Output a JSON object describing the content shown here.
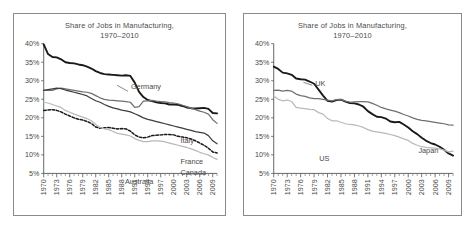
{
  "figure": {
    "background_color": "#ffffff",
    "panel_border_color": "#8a8a8a"
  },
  "panels": [
    {
      "id": "left",
      "title_line1": "Share of Jobs in Manufacturing,",
      "title_line2": "1970–2010",
      "series_labels": [
        "Germany",
        "Italy",
        "France",
        "Canada",
        "Australia"
      ]
    },
    {
      "id": "right",
      "title_line1": "Share of Jobs in Manufacturing,",
      "title_line2": "1970–2010",
      "series_labels": [
        "UK",
        "US",
        "Japan"
      ]
    }
  ],
  "chart_data": [
    {
      "type": "line",
      "panel": "left",
      "title": "Share of Jobs in Manufacturing, 1970–2010",
      "xlabel": "",
      "ylabel": "",
      "ylim": [
        5,
        40
      ],
      "yticks": [
        5,
        10,
        15,
        20,
        25,
        30,
        35,
        40
      ],
      "ytick_labels": [
        "5%",
        "10%",
        "15%",
        "20%",
        "25%",
        "30%",
        "35%",
        "40%"
      ],
      "xlim": [
        1970,
        2010
      ],
      "xticks": [
        1970,
        1973,
        1976,
        1979,
        1982,
        1985,
        1988,
        1991,
        1994,
        1997,
        2000,
        2003,
        2006,
        2009
      ],
      "xtick_labels": [
        "1970",
        "1973",
        "1976",
        "1979",
        "1982",
        "1985",
        "1988",
        "1991",
        "1994",
        "1997",
        "2000",
        "2003",
        "2006",
        "2009"
      ],
      "grid": false,
      "legend": "inline-labels",
      "x": [
        1970,
        1971,
        1972,
        1973,
        1974,
        1975,
        1976,
        1977,
        1978,
        1979,
        1980,
        1981,
        1982,
        1983,
        1984,
        1985,
        1986,
        1987,
        1988,
        1989,
        1990,
        1991,
        1992,
        1993,
        1994,
        1995,
        1996,
        1997,
        1998,
        1999,
        2000,
        2001,
        2002,
        2003,
        2004,
        2005,
        2006,
        2007,
        2008,
        2009,
        2010
      ],
      "series": [
        {
          "name": "Germany",
          "style": "solid-black-thick",
          "color": "#1a1a1a",
          "values": [
            39.8,
            37.2,
            36.4,
            36.3,
            35.8,
            35.0,
            34.8,
            34.7,
            34.4,
            34.2,
            33.8,
            33.3,
            32.6,
            32.1,
            31.8,
            31.7,
            31.6,
            31.5,
            31.4,
            31.5,
            31.3,
            29.5,
            27.0,
            25.6,
            24.8,
            24.5,
            24.2,
            24.0,
            23.9,
            23.6,
            23.6,
            23.5,
            23.2,
            22.8,
            22.6,
            22.5,
            22.6,
            22.7,
            22.4,
            21.3,
            21.2
          ]
        },
        {
          "name": "Italy",
          "style": "solid-gray",
          "color": "#6f6f6f",
          "values": [
            27.5,
            27.4,
            27.4,
            27.8,
            28.0,
            27.8,
            27.6,
            27.4,
            27.2,
            27.0,
            26.9,
            26.6,
            26.0,
            25.4,
            25.0,
            24.8,
            24.7,
            24.6,
            24.5,
            24.4,
            24.2,
            22.8,
            23.0,
            24.5,
            24.6,
            24.7,
            24.5,
            24.4,
            24.3,
            24.1,
            24.0,
            23.8,
            23.4,
            23.0,
            22.6,
            22.2,
            21.8,
            21.5,
            21.0,
            19.5,
            18.5
          ]
        },
        {
          "name": "France",
          "style": "solid-dark-gray",
          "color": "#3d3d3d",
          "values": [
            27.4,
            27.6,
            27.8,
            28.0,
            27.9,
            27.5,
            27.2,
            26.9,
            26.6,
            26.3,
            25.9,
            25.2,
            24.6,
            24.2,
            23.6,
            23.1,
            22.7,
            22.4,
            22.1,
            21.9,
            21.6,
            21.1,
            20.6,
            20.0,
            19.6,
            19.3,
            19.0,
            18.7,
            18.4,
            18.1,
            17.8,
            17.5,
            17.2,
            16.9,
            16.6,
            16.3,
            16.1,
            15.9,
            15.2,
            13.8,
            13.0
          ]
        },
        {
          "name": "Canada",
          "style": "dashed-black",
          "color": "#1a1a1a",
          "values": [
            22.0,
            22.1,
            22.2,
            22.0,
            21.6,
            21.0,
            20.5,
            20.0,
            19.6,
            19.4,
            19.0,
            18.5,
            17.5,
            17.2,
            17.3,
            17.4,
            17.2,
            17.0,
            17.1,
            17.0,
            16.4,
            15.4,
            14.8,
            14.6,
            14.8,
            15.2,
            15.3,
            15.4,
            15.5,
            15.5,
            15.4,
            15.0,
            14.8,
            14.6,
            14.3,
            13.8,
            13.2,
            12.6,
            11.8,
            10.8,
            10.5
          ]
        },
        {
          "name": "Australia",
          "style": "solid-light-gray",
          "color": "#b8b8b8",
          "values": [
            24.2,
            24.0,
            23.6,
            23.2,
            22.8,
            22.0,
            21.5,
            21.0,
            20.6,
            20.2,
            19.8,
            19.2,
            18.2,
            17.4,
            17.0,
            16.8,
            16.3,
            15.8,
            15.6,
            15.4,
            15.1,
            14.4,
            13.9,
            13.6,
            13.6,
            13.8,
            13.8,
            13.7,
            13.5,
            13.2,
            12.9,
            12.6,
            12.3,
            12.0,
            11.6,
            11.2,
            10.7,
            10.3,
            10.0,
            9.3,
            8.8
          ]
        }
      ]
    },
    {
      "type": "line",
      "panel": "right",
      "title": "Share of Jobs in Manufacturing, 1970–2010",
      "xlabel": "",
      "ylabel": "",
      "ylim": [
        5,
        40
      ],
      "yticks": [
        5,
        10,
        15,
        20,
        25,
        30,
        35,
        40
      ],
      "ytick_labels": [
        "5%",
        "10%",
        "15%",
        "20%",
        "25%",
        "30%",
        "35%",
        "40%"
      ],
      "xlim": [
        1970,
        2010
      ],
      "xticks": [
        1970,
        1973,
        1976,
        1979,
        1982,
        1985,
        1988,
        1991,
        1994,
        1997,
        2000,
        2003,
        2006,
        2009
      ],
      "xtick_labels": [
        "1970",
        "1973",
        "1976",
        "1979",
        "1982",
        "1985",
        "1988",
        "1991",
        "1994",
        "1997",
        "2000",
        "2003",
        "2006",
        "2009"
      ],
      "grid": false,
      "legend": "inline-labels",
      "x": [
        1970,
        1971,
        1972,
        1973,
        1974,
        1975,
        1976,
        1977,
        1978,
        1979,
        1980,
        1981,
        1982,
        1983,
        1984,
        1985,
        1986,
        1987,
        1988,
        1989,
        1990,
        1991,
        1992,
        1993,
        1994,
        1995,
        1996,
        1997,
        1998,
        1999,
        2000,
        2001,
        2002,
        2003,
        2004,
        2005,
        2006,
        2007,
        2008,
        2009,
        2010
      ],
      "series": [
        {
          "name": "UK",
          "style": "solid-black-thick",
          "color": "#1a1a1a",
          "values": [
            33.8,
            33.2,
            32.2,
            32.0,
            31.6,
            30.6,
            30.4,
            30.3,
            29.8,
            29.2,
            27.6,
            26.0,
            24.6,
            24.4,
            24.8,
            24.9,
            24.4,
            24.0,
            23.9,
            23.6,
            23.0,
            21.8,
            21.0,
            20.3,
            20.2,
            19.8,
            19.0,
            18.8,
            18.9,
            18.2,
            17.4,
            16.4,
            15.6,
            14.6,
            13.8,
            13.2,
            12.8,
            12.2,
            11.4,
            10.4,
            9.8
          ]
        },
        {
          "name": "Japan",
          "style": "solid-gray",
          "color": "#6f6f6f",
          "values": [
            27.4,
            27.5,
            27.2,
            27.4,
            27.2,
            26.4,
            26.0,
            25.8,
            25.4,
            25.2,
            25.2,
            25.0,
            24.8,
            24.6,
            24.9,
            24.9,
            24.5,
            24.2,
            24.3,
            24.4,
            24.4,
            24.3,
            23.9,
            23.4,
            22.8,
            22.4,
            22.1,
            21.8,
            21.4,
            20.9,
            20.5,
            20.0,
            19.6,
            19.3,
            19.2,
            19.0,
            18.8,
            18.6,
            18.4,
            18.1,
            18.0
          ]
        },
        {
          "name": "US",
          "style": "solid-light-gray",
          "color": "#b8b8b8",
          "values": [
            25.9,
            25.0,
            24.6,
            24.8,
            24.4,
            22.8,
            22.6,
            22.5,
            22.3,
            22.2,
            21.4,
            21.0,
            19.8,
            19.2,
            19.2,
            18.8,
            18.4,
            18.2,
            18.1,
            17.8,
            17.4,
            16.8,
            16.4,
            16.2,
            16.0,
            15.8,
            15.5,
            15.2,
            14.8,
            14.3,
            13.9,
            13.1,
            12.6,
            12.2,
            12.0,
            11.9,
            11.8,
            11.6,
            11.3,
            10.8,
            11.0
          ]
        }
      ]
    }
  ]
}
